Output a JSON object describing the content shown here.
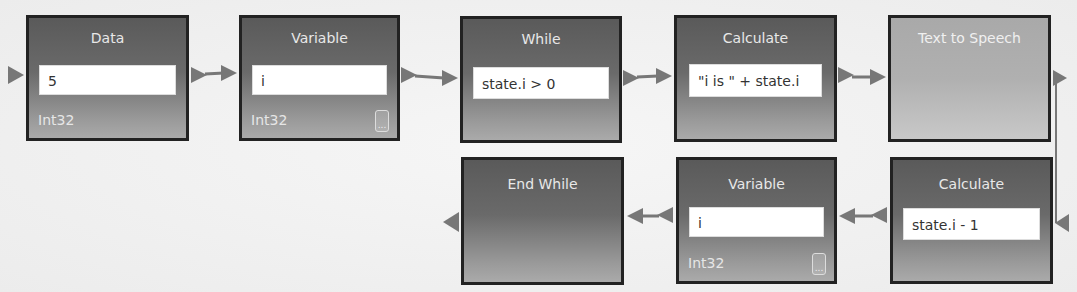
{
  "diagram": {
    "row1": [
      {
        "id": "data",
        "title": "Data",
        "value": "5",
        "type": "Int32"
      },
      {
        "id": "variable1",
        "title": "Variable",
        "value": "i",
        "type": "Int32",
        "more": "..."
      },
      {
        "id": "while",
        "title": "While",
        "value": "state.i > 0"
      },
      {
        "id": "calculate1",
        "title": "Calculate",
        "value": "\"i is \" + state.i"
      },
      {
        "id": "tts",
        "title": "Text to Speech"
      }
    ],
    "row2": [
      {
        "id": "endwhile",
        "title": "End While"
      },
      {
        "id": "variable2",
        "title": "Variable",
        "value": "i",
        "type": "Int32",
        "more": "..."
      },
      {
        "id": "calculate2",
        "title": "Calculate",
        "value": "state.i - 1"
      }
    ],
    "colors": {
      "background": "#f2f2f2",
      "block_dark": "#5a5a5a",
      "block_light": "#b0b0b0",
      "border": "#222222",
      "wire": "#777777"
    }
  }
}
